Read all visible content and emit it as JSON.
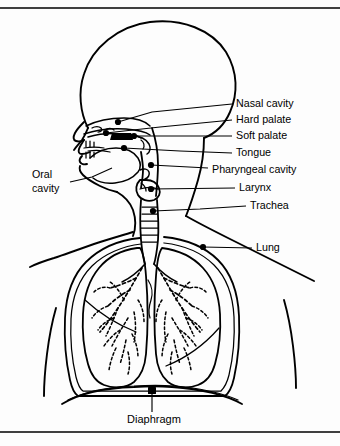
{
  "figure": {
    "background_color": "#fdfdfd",
    "ink_color": "#000000",
    "frame": {
      "top_rule_y": 8,
      "bottom_rule_y": 432,
      "visible": true
    }
  },
  "labels": {
    "right_column": [
      {
        "id": "nasal-cavity",
        "text": "Nasal cavity",
        "text_x": 236,
        "text_y": 104,
        "dot_x": 118,
        "dot_y": 122
      },
      {
        "id": "hard-palate",
        "text": "Hard palate",
        "text_x": 236,
        "text_y": 120,
        "dot_x": 106,
        "dot_y": 133
      },
      {
        "id": "soft-palate",
        "text": "Soft palate",
        "text_x": 236,
        "text_y": 136,
        "dot_x": 134,
        "dot_y": 136
      },
      {
        "id": "tongue",
        "text": "Tongue",
        "text_x": 236,
        "text_y": 153,
        "dot_x": 124,
        "dot_y": 148
      },
      {
        "id": "pharyngeal-cavity",
        "text": "Pharyngeal cavity",
        "text_x": 212,
        "text_y": 170,
        "dot_x": 151,
        "dot_y": 165
      },
      {
        "id": "larynx",
        "text": "Larynx",
        "text_x": 239,
        "text_y": 188,
        "dot_x": 151,
        "dot_y": 189
      },
      {
        "id": "trachea",
        "text": "Trachea",
        "text_x": 250,
        "text_y": 206,
        "dot_x": 153,
        "dot_y": 211
      },
      {
        "id": "lung",
        "text": "Lung",
        "text_x": 256,
        "text_y": 248,
        "dot_x": 203,
        "dot_y": 247
      }
    ],
    "left_column": [
      {
        "id": "oral-cavity",
        "text_line_1": "Oral",
        "text_line_2": "cavity",
        "text_x": 32,
        "text_y_1": 175,
        "text_y_2": 189
      }
    ],
    "bottom": [
      {
        "id": "diaphragm",
        "text": "Diaphragm",
        "text_x": 154,
        "text_y": 420,
        "marker_x": 152,
        "marker_y": 391
      }
    ]
  },
  "anatomy_parts": [
    "cranium",
    "facial-profile",
    "nasal-cavity",
    "hard-palate",
    "soft-palate",
    "tongue",
    "oral-cavity",
    "pharyngeal-cavity",
    "larynx",
    "trachea",
    "left-lung",
    "right-lung",
    "bronchial-tree",
    "diaphragm",
    "rib-cage",
    "shoulders",
    "neck"
  ]
}
